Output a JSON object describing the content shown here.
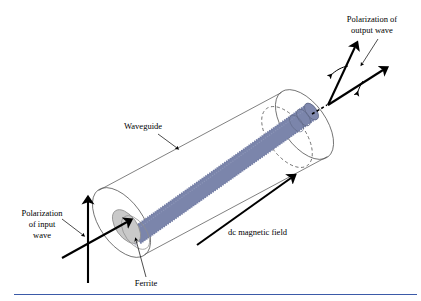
{
  "figure": {
    "background_color": "#ffffff",
    "rule_color": "#3b5aa8"
  },
  "labels": {
    "output_polarization": {
      "line1": "Polarization of",
      "line2": "output wave"
    },
    "input_polarization": {
      "line1": "Polarization",
      "line2": "of input",
      "line3": "wave"
    },
    "waveguide": "Waveguide",
    "ferrite": "Ferrite",
    "dc_magnetic_field": "dc magnetic field"
  },
  "colors": {
    "ferrite_rod": "#7b85ab",
    "ferrite_rod_shade": "#6f79a2",
    "ferrite_endcap": "#c9c9c9",
    "ferrite_endcap_edge": "#8e8e8e",
    "waveguide_outline": "#4a4a4a",
    "arrow": "#000000",
    "text": "#000000"
  }
}
